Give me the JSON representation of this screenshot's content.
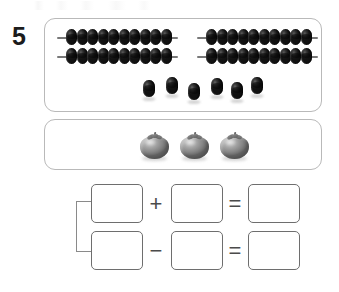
{
  "worksheet": {
    "problem_number": "5",
    "top_artifact_label": "faint-scan-artifact"
  },
  "panels": {
    "abacus_panel": {
      "name": "abacus-panel",
      "left_abacus": {
        "name": "left-abacus",
        "rows": [
          {
            "label": "row-1",
            "bead_count": 10
          },
          {
            "label": "row-2",
            "bead_count": 10
          }
        ],
        "total": 20
      },
      "right_abacus": {
        "name": "right-abacus",
        "rows": [
          {
            "label": "row-1",
            "bead_count": 10
          },
          {
            "label": "row-2",
            "bead_count": 10
          }
        ],
        "total": 20
      },
      "loose_beads": {
        "name": "loose-beads",
        "count": 6,
        "positions": [
          0,
          23,
          45,
          68,
          88,
          108
        ]
      },
      "bead_color": "#1b1b1b",
      "rod_color": "#6f6f6f",
      "total_beads": 46
    },
    "fruit_panel": {
      "name": "fruit-panel",
      "fruit_type": "tomato",
      "count": 3,
      "positions": [
        0,
        40,
        80
      ],
      "fruit_color": "#9b9b9b",
      "stem_color": "#6b6b6b"
    },
    "panel_border_color": "#b9b9b9"
  },
  "equations": {
    "bracket_label": "bracket-connector",
    "rows": [
      {
        "name": "addition-row",
        "operator": "+",
        "equals": "=",
        "boxes": [
          {
            "name": "addend-1-box",
            "value": ""
          },
          {
            "name": "addend-2-box",
            "value": ""
          },
          {
            "name": "sum-box",
            "value": ""
          }
        ]
      },
      {
        "name": "subtraction-row",
        "operator": "−",
        "equals": "=",
        "boxes": [
          {
            "name": "minuend-box",
            "value": ""
          },
          {
            "name": "subtrahend-box",
            "value": ""
          },
          {
            "name": "difference-box",
            "value": ""
          }
        ]
      }
    ],
    "box_border_color": "#6e6e6e",
    "operator_color": "#4b4b4b"
  }
}
